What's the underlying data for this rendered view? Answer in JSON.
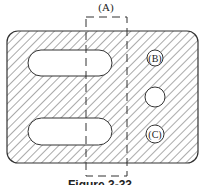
{
  "figure": {
    "caption": "Figure 3-33",
    "section_label": "(A)",
    "labels": {
      "b": "B",
      "c": "C"
    },
    "colors": {
      "line": "#333333",
      "hatch": "#555555",
      "background": "#ffffff"
    }
  },
  "diagram": {
    "plate": {
      "x": 7,
      "y": 31,
      "width": 191,
      "height": 132,
      "corner_radius": 11
    },
    "slots": [
      {
        "name": "upper-slot",
        "x": 28,
        "y": 50,
        "width": 84,
        "height": 26
      },
      {
        "name": "lower-slot",
        "x": 28,
        "y": 118,
        "width": 84,
        "height": 27
      }
    ],
    "circles": [
      {
        "name": "circle-b",
        "cx": 155,
        "cy": 58,
        "r": 8,
        "label": "B"
      },
      {
        "name": "hole-middle",
        "cx": 155,
        "cy": 97,
        "r": 10
      },
      {
        "name": "circle-c",
        "cx": 155,
        "cy": 134,
        "r": 9,
        "label": "C"
      }
    ],
    "section_box": {
      "x": 86,
      "y": 17,
      "width": 41,
      "height": 159,
      "dashed": true
    }
  }
}
